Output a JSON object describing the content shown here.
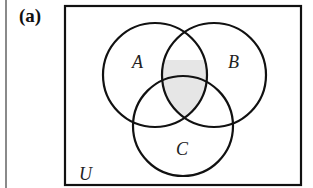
{
  "panel": {
    "label": "(a)"
  },
  "diagram": {
    "universe_label": "U",
    "sets": [
      {
        "name": "A",
        "label": "A"
      },
      {
        "name": "B",
        "label": "B"
      },
      {
        "name": "C",
        "label": "C"
      }
    ],
    "shaded_region": "A ∩ B ∩ C (plus A ∩ B)",
    "colors": {
      "stroke": "#111111",
      "shade": "#e6e6e6",
      "background": "#ffffff"
    }
  }
}
